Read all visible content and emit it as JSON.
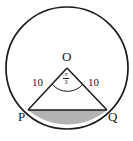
{
  "figure": {
    "type": "circle-segment-geometry-diagram",
    "background_color": "#ffffff",
    "stroke_color": "#1a1a1a",
    "shaded_fill_color": "#b3b3b3",
    "circle": {
      "center_label": "O",
      "center_x": 67,
      "center_y": 68,
      "radius_px": 61
    },
    "labels": {
      "center": "O",
      "left_point": "P",
      "right_point": "Q",
      "left_radius_length": "10",
      "right_radius_length": "10"
    },
    "angle": {
      "vertex": "O",
      "numerator": "π",
      "denominator": "3",
      "full_text": "π/3"
    },
    "points": {
      "O": {
        "x": 67,
        "y": 68
      },
      "P": {
        "x": 28,
        "y": 110
      },
      "Q": {
        "x": 107,
        "y": 110
      }
    }
  }
}
